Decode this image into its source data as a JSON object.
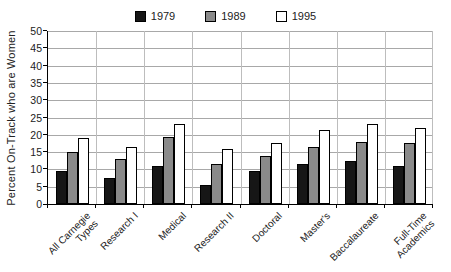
{
  "chart_data": {
    "type": "bar",
    "title": "",
    "xlabel": "",
    "ylabel": "Percent On-Track who are Women",
    "ylim": [
      0,
      50
    ],
    "yticks": [
      0,
      5,
      10,
      15,
      20,
      25,
      30,
      35,
      40,
      45,
      50
    ],
    "grid": "horizontal gridlines every 5 units; faint vertical category separators",
    "legend_position": "top-center",
    "categories": [
      "All Carnegie Types",
      "Research I",
      "Medical",
      "Research II",
      "Doctoral",
      "Master's",
      "Baccalaureate",
      "Full-Time Academics"
    ],
    "category_label_lines": [
      [
        "All Carnegie",
        "Types"
      ],
      [
        "Research I"
      ],
      [
        "Medical"
      ],
      [
        "Research II"
      ],
      [
        "Doctoral"
      ],
      [
        "Master's"
      ],
      [
        "Baccalaureate"
      ],
      [
        "Full-Time",
        "Academics"
      ]
    ],
    "series": [
      {
        "name": "1979",
        "color": "#161616",
        "values": [
          9.5,
          7.5,
          11,
          5.5,
          9.5,
          11.5,
          12.5,
          11
        ]
      },
      {
        "name": "1989",
        "color": "#8a8a8a",
        "values": [
          15,
          13,
          19.5,
          11.5,
          14,
          16.5,
          18,
          17.5
        ]
      },
      {
        "name": "1995",
        "color": "#ffffff",
        "values": [
          19,
          16.5,
          23,
          16,
          17.5,
          21.5,
          23,
          22
        ]
      }
    ],
    "bar_border_color": "#000000",
    "gridline_color": "#a8a8a8",
    "separator_color": "#bdbdbd",
    "axis_color": "#000000"
  }
}
